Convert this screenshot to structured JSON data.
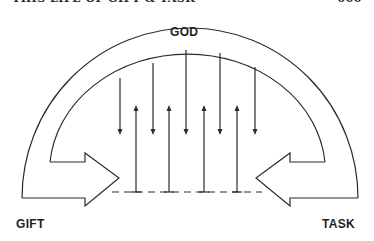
{
  "header": {
    "running_title": "THIS LIFE OF GIFT & TASK",
    "page_number": "000"
  },
  "diagram": {
    "top_label": "GOD",
    "left_label": "GIFT",
    "right_label": "TASK",
    "stroke_color": "#2b2b2b",
    "down_arrows_x": [
      120,
      153,
      186,
      220,
      255
    ],
    "up_arrows_x": [
      136,
      169,
      204,
      237
    ]
  }
}
